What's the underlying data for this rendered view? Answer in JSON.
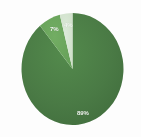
{
  "chart_data": {
    "type": "pie",
    "title": "",
    "categories": [
      "Major share",
      "Secondary share",
      "Minor share"
    ],
    "values": [
      89,
      7,
      4
    ],
    "labels": [
      "89%",
      "7%",
      "4%"
    ],
    "colors": [
      "#4a7a45",
      "#6aa55c",
      "#d3e2cc"
    ],
    "legend": "none",
    "grid": false,
    "start_angle_deg": 0,
    "direction": "clockwise",
    "background": "#fdfdfd",
    "label_color": "#ffffff",
    "geometry": {
      "center_x": 72.5,
      "center_y": 69,
      "radius_x": 51,
      "radius_y": 56
    }
  },
  "slices": [
    {
      "name": "major",
      "label": "89%",
      "value": 89,
      "color": "#4a7a45"
    },
    {
      "name": "secondary",
      "label": "7%",
      "value": 7,
      "color": "#6aa55c"
    },
    {
      "name": "minor",
      "label": "4%",
      "value": 4,
      "color": "#d3e2cc"
    }
  ]
}
